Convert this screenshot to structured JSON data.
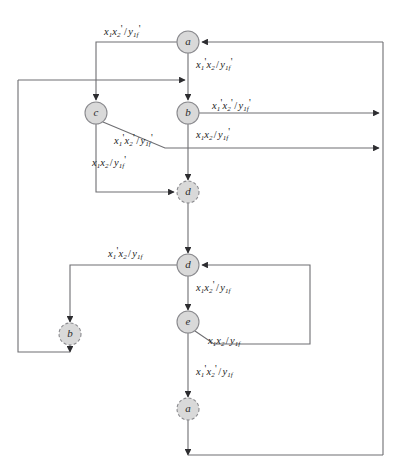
{
  "diagram": {
    "type": "state-transition-flow-diagram",
    "title": "",
    "canvas": {
      "width": 405,
      "height": 476
    },
    "colors": {
      "node_fill": "#d9d9d9",
      "node_stroke": "#8a8a8e",
      "edge_stroke": "#6e6e72",
      "text": "#1d1d1d",
      "background": "#ffffff"
    },
    "nodes": [
      {
        "id": "a-top",
        "label": "a",
        "x": 188,
        "y": 42,
        "r": 11,
        "style": "solid"
      },
      {
        "id": "c",
        "label": "c",
        "x": 96,
        "y": 113,
        "r": 11,
        "style": "solid"
      },
      {
        "id": "b",
        "label": "b",
        "x": 188,
        "y": 113,
        "r": 11,
        "style": "solid"
      },
      {
        "id": "d-dashed",
        "label": "d",
        "x": 188,
        "y": 192,
        "r": 11,
        "style": "dashed"
      },
      {
        "id": "d",
        "label": "d",
        "x": 188,
        "y": 265,
        "r": 11,
        "style": "solid"
      },
      {
        "id": "b-dashed",
        "label": "b",
        "x": 70,
        "y": 334,
        "r": 11,
        "style": "dashed"
      },
      {
        "id": "e",
        "label": "e",
        "x": 188,
        "y": 322,
        "r": 11,
        "style": "solid"
      },
      {
        "id": "a-dashed",
        "label": "a",
        "x": 188,
        "y": 409,
        "r": 11,
        "style": "dashed"
      }
    ],
    "edge_labels": [
      {
        "id": "lbl-a-to-c",
        "x": 104,
        "y": 24,
        "x1": "x",
        "s1": "1",
        "p1": "",
        "x2": "x",
        "s2": "2",
        "p2": "'",
        "y_var": "y",
        "y_sub": "1f",
        "y_prime": "'"
      },
      {
        "id": "lbl-a-to-b",
        "x": 196,
        "y": 57,
        "x1": "x",
        "s1": "1",
        "p1": "'",
        "x2": "x",
        "s2": "2",
        "p2": "",
        "y_var": "y",
        "y_sub": "1f",
        "y_prime": "'"
      },
      {
        "id": "lbl-b-right1",
        "x": 212,
        "y": 98,
        "x1": "x",
        "s1": "1",
        "p1": "'",
        "x2": "x",
        "s2": "2",
        "p2": "'",
        "y_var": "y",
        "y_sub": "1f",
        "y_prime": "'"
      },
      {
        "id": "lbl-b-right2",
        "x": 196,
        "y": 127,
        "x1": "x",
        "s1": "1",
        "p1": "",
        "x2": "x",
        "s2": "2",
        "p2": "",
        "y_var": "y",
        "y_sub": "1f",
        "y_prime": "'"
      },
      {
        "id": "lbl-c-diag",
        "x": 114,
        "y": 133,
        "x1": "x",
        "s1": "1",
        "p1": "'",
        "x2": "x",
        "s2": "2",
        "p2": "'",
        "y_var": "y",
        "y_sub": "1f",
        "y_prime": "'"
      },
      {
        "id": "lbl-c-down",
        "x": 92,
        "y": 155,
        "x1": "x",
        "s1": "1",
        "p1": "",
        "x2": "x",
        "s2": "2",
        "p2": "",
        "y_var": "y",
        "y_sub": "1f",
        "y_prime": "'"
      },
      {
        "id": "lbl-d-left",
        "x": 108,
        "y": 246,
        "x1": "x",
        "s1": "1",
        "p1": "'",
        "x2": "x",
        "s2": "2",
        "p2": "",
        "y_var": "y",
        "y_sub": "1f",
        "y_prime": ""
      },
      {
        "id": "lbl-d-to-e",
        "x": 196,
        "y": 280,
        "x1": "x",
        "s1": "1",
        "p1": "",
        "x2": "x",
        "s2": "2",
        "p2": "'",
        "y_var": "y",
        "y_sub": "1f",
        "y_prime": ""
      },
      {
        "id": "lbl-e-diag",
        "x": 208,
        "y": 336,
        "x1": "x",
        "s1": "1",
        "p1": "",
        "x2": "x",
        "s2": "2",
        "p2": "",
        "y_var": "y",
        "y_sub": "1f",
        "y_prime": ""
      },
      {
        "id": "lbl-e-down",
        "x": 196,
        "y": 364,
        "x1": "x",
        "s1": "1",
        "p1": "'",
        "x2": "x",
        "s2": "2",
        "p2": "'",
        "y_var": "y",
        "y_sub": "1f",
        "y_prime": ""
      }
    ],
    "transitions": [
      {
        "id": "t-a-to-c",
        "from": "a-top",
        "to": "c",
        "label": "lbl-a-to-c"
      },
      {
        "id": "t-a-to-b",
        "from": "a-top",
        "to": "b",
        "label": "lbl-a-to-b"
      },
      {
        "id": "t-b-right-1",
        "from": "b",
        "to": "right-bus",
        "label": "lbl-b-right1"
      },
      {
        "id": "t-b-right-2",
        "from": "b",
        "to": "right-bus",
        "label": "lbl-b-right2"
      },
      {
        "id": "t-c-to-d",
        "from": "c",
        "to": "d-dashed",
        "label": "lbl-c-diag"
      },
      {
        "id": "t-c-down",
        "from": "c",
        "to": "left-bus",
        "label": "lbl-c-down"
      },
      {
        "id": "t-d-to-b",
        "from": "d",
        "to": "b-dashed",
        "label": "lbl-d-left"
      },
      {
        "id": "t-d-to-e",
        "from": "d",
        "to": "e",
        "label": "lbl-d-to-e"
      },
      {
        "id": "t-e-to-d",
        "from": "e",
        "to": "d",
        "label": "lbl-e-diag"
      },
      {
        "id": "t-e-to-a",
        "from": "e",
        "to": "a-dashed",
        "label": "lbl-e-down"
      }
    ]
  }
}
